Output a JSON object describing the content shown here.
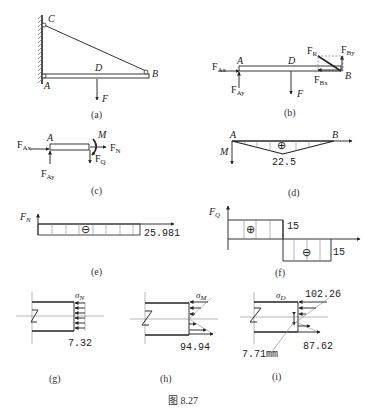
{
  "figure": {
    "caption": "图 8.27",
    "panels": {
      "a": {
        "caption": "(a)",
        "labels": {
          "C": "C",
          "A": "A",
          "D": "D",
          "B": "B",
          "F": "F"
        }
      },
      "b": {
        "caption": "(b)",
        "labels": {
          "FAx": "F",
          "FAx_sub": "Ax",
          "FAy": "F",
          "FAy_sub": "Ay",
          "A": "A",
          "D": "D",
          "B": "B",
          "F": "F",
          "FR": "F",
          "FR_sub": "R",
          "FBy": "F",
          "FBy_sub": "By",
          "FBx": "F",
          "FBx_sub": "Bx"
        }
      },
      "c": {
        "caption": "(c)",
        "labels": {
          "FAx": "F",
          "FAx_sub": "Ax",
          "FAy": "F",
          "FAy_sub": "Ay",
          "A": "A",
          "M": "M",
          "FN": "F",
          "FN_sub": "N",
          "FQ": "F",
          "FQ_sub": "Q"
        }
      },
      "d": {
        "caption": "(d)",
        "labels": {
          "A": "A",
          "B": "B",
          "M": "M",
          "sign": "⊕",
          "value": "22.5"
        }
      },
      "e": {
        "caption": "(e)",
        "labels": {
          "FN": "F",
          "FN_sub": "N",
          "sign": "⊖",
          "value": "25.981"
        }
      },
      "f": {
        "caption": "(f)",
        "labels": {
          "FQ": "F",
          "FQ_sub": "Q",
          "sign_pos": "⊕",
          "sign_neg": "⊖",
          "value_pos": "15",
          "value_neg": "15"
        }
      },
      "g": {
        "caption": "(g)",
        "labels": {
          "sigma": "σ",
          "sigma_sub": "N",
          "value": "7.32"
        }
      },
      "h": {
        "caption": "(h)",
        "labels": {
          "sigma": "σ",
          "sigma_sub": "M",
          "value": "94.94"
        }
      },
      "i": {
        "caption": "(i)",
        "labels": {
          "sigma": "σ",
          "sigma_sub": "D",
          "value_top": "102.26",
          "value_bottom": "87.62",
          "offset": "7.71mm"
        }
      }
    }
  }
}
